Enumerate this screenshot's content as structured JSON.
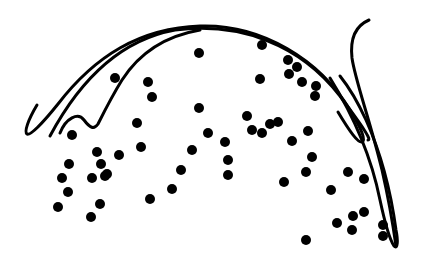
{
  "figure": {
    "background": "#ffffff",
    "ink_color": "#000000",
    "dot_radius": 5,
    "strokes": [
      {
        "name": "outer-arc",
        "d": "M 37 105 C 28 120 24 132 27 134 C 30 136 42 124 58 104 C 95 56 140 28 200 26 C 262 24 320 60 350 110 C 362 130 366 140 362 142 C 358 143 350 132 338 112"
      },
      {
        "name": "inner-arc",
        "d": "M 50 136 C 80 80 120 40 175 30 C 240 22 300 44 340 96 C 362 126 372 140 368 140"
      },
      {
        "name": "inner-wave",
        "d": "M 60 133 C 66 118 78 112 84 120 C 90 128 94 130 98 124 C 104 112 112 96 122 80 C 140 52 165 36 200 30"
      },
      {
        "name": "right-hook",
        "d": "M 369 20 C 355 26 350 40 352 58 C 355 80 370 120 382 170 C 390 205 394 232 396 246"
      },
      {
        "name": "right-tail-inner",
        "d": "M 330 78 C 350 110 370 150 380 200 C 386 228 390 240 394 246 C 398 250 398 240 396 230 C 392 200 384 160 366 120 C 356 98 348 86 340 76"
      }
    ],
    "dots": [
      [
        115,
        78
      ],
      [
        148,
        82
      ],
      [
        152,
        97
      ],
      [
        199,
        53
      ],
      [
        199,
        108
      ],
      [
        72,
        135
      ],
      [
        262,
        45
      ],
      [
        288,
        60
      ],
      [
        297,
        67
      ],
      [
        289,
        74
      ],
      [
        302,
        82
      ],
      [
        316,
        86
      ],
      [
        315,
        96
      ],
      [
        260,
        79
      ],
      [
        137,
        123
      ],
      [
        141,
        147
      ],
      [
        97,
        152
      ],
      [
        119,
        155
      ],
      [
        101,
        164
      ],
      [
        69,
        164
      ],
      [
        107,
        174
      ],
      [
        62,
        178
      ],
      [
        92,
        178
      ],
      [
        105,
        176
      ],
      [
        58,
        207
      ],
      [
        91,
        217
      ],
      [
        100,
        204
      ],
      [
        68,
        192
      ],
      [
        208,
        133
      ],
      [
        225,
        142
      ],
      [
        228,
        160
      ],
      [
        228,
        175
      ],
      [
        192,
        150
      ],
      [
        181,
        170
      ],
      [
        172,
        189
      ],
      [
        150,
        199
      ],
      [
        247,
        116
      ],
      [
        252,
        130
      ],
      [
        262,
        133
      ],
      [
        270,
        124
      ],
      [
        278,
        122
      ],
      [
        308,
        131
      ],
      [
        292,
        141
      ],
      [
        312,
        157
      ],
      [
        306,
        172
      ],
      [
        284,
        182
      ],
      [
        331,
        190
      ],
      [
        348,
        172
      ],
      [
        364,
        179
      ],
      [
        353,
        216
      ],
      [
        364,
        212
      ],
      [
        337,
        223
      ],
      [
        352,
        230
      ],
      [
        383,
        225
      ],
      [
        383,
        236
      ],
      [
        306,
        240
      ]
    ]
  }
}
